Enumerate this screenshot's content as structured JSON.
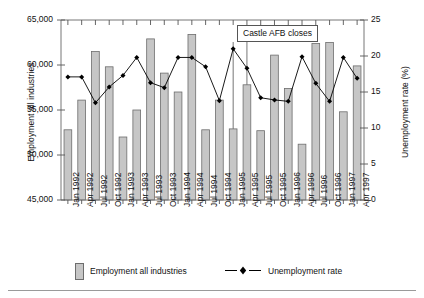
{
  "chart_data": {
    "type": "bar",
    "title": "",
    "xlabel": "",
    "ylabel": "Employment all industries",
    "y2label": "Unemployment rate (%)",
    "ylim": [
      45000,
      65000
    ],
    "y2lim": [
      0,
      25
    ],
    "yticks": [
      "45,000",
      "50,000",
      "55,000",
      "60,000",
      "65,000"
    ],
    "ytick_values": [
      45000,
      50000,
      55000,
      60000,
      65000
    ],
    "y2ticks": [
      "0",
      "5",
      "10",
      "15",
      "20",
      "25"
    ],
    "y2tick_values": [
      0,
      5,
      10,
      15,
      20,
      25
    ],
    "grid": false,
    "legend_position": "bottom",
    "categories": [
      "Jan 1992",
      "Apr 1992",
      "Jul 1992",
      "Oct 1992",
      "Jan 1993",
      "Apr 1993",
      "Jul 1993",
      "Oct 1993",
      "Jan 1994",
      "Apr 1994",
      "Jul 1994",
      "Oct 1994",
      "Jan 1995",
      "Apr 1995",
      "Jul 1995",
      "Oct 1995",
      "Jan 1996",
      "Apr 1996",
      "Jul 1996",
      "Oct 1996",
      "Jan 1997",
      "Apr 1997"
    ],
    "series": [
      {
        "name": "Employment all industries",
        "type": "bar",
        "axis": "left",
        "color": "#c6c6c6",
        "edge_color": "#6d6d6d",
        "values": [
          52800,
          56100,
          61500,
          59800,
          52000,
          55000,
          62900,
          59100,
          57000,
          63400,
          52800,
          56100,
          52900,
          57800,
          52700,
          61100,
          57400,
          51200,
          62400,
          62500,
          54800,
          59900
        ]
      },
      {
        "name": "Unemployment rate",
        "type": "line",
        "axis": "right",
        "color": "#000000",
        "marker": "diamond",
        "values": [
          17.1,
          17.1,
          13.5,
          15.7,
          17.3,
          19.8,
          16.3,
          15.6,
          19.8,
          19.8,
          18.5,
          13.8,
          21.0,
          18.3,
          14.2,
          13.9,
          13.7,
          19.9,
          16.2,
          13.7,
          19.8,
          16.9
        ]
      }
    ],
    "annotations": [
      {
        "text": "Castle AFB closes",
        "points_to": [
          "Jan 1995",
          "Apr 1995"
        ]
      }
    ]
  },
  "legend": {
    "bar_label": "Employment all industries",
    "line_label": "Unemployment rate"
  },
  "icons": {
    "bar_swatch": "bar-swatch-icon",
    "line_marker": "diamond-marker-icon"
  }
}
